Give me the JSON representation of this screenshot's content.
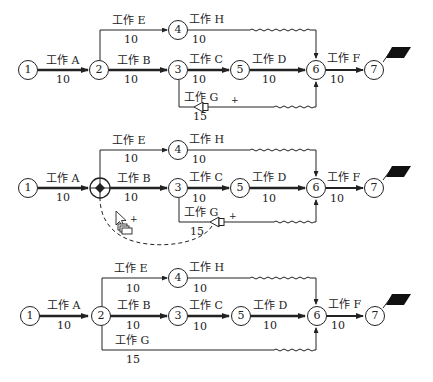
{
  "diagrams": [
    {
      "id": "original",
      "nodes": [
        "1",
        "2",
        "3",
        "4",
        "5",
        "6",
        "7"
      ],
      "activities": {
        "A": {
          "label": "工作 A",
          "duration": "10"
        },
        "B": {
          "label": "工作 B",
          "duration": "10"
        },
        "C": {
          "label": "工作 C",
          "duration": "10"
        },
        "D": {
          "label": "工作 D",
          "duration": "10"
        },
        "E": {
          "label": "工作 E",
          "duration": "10"
        },
        "F": {
          "label": "工作 F",
          "duration": "10"
        },
        "G": {
          "label": "工作 G",
          "duration": "15"
        },
        "H": {
          "label": "工作 H",
          "duration": "10"
        }
      },
      "g_start_node": "3",
      "g_handle_symbol": "+"
    },
    {
      "id": "dragging",
      "nodes": [
        "1",
        "",
        "3",
        "4",
        "5",
        "6",
        "7"
      ],
      "activities": {
        "A": {
          "label": "工作 A",
          "duration": "10"
        },
        "B": {
          "label": "工作 B",
          "duration": "10"
        },
        "C": {
          "label": "工作 C",
          "duration": "10"
        },
        "D": {
          "label": "工作 D",
          "duration": "10"
        },
        "E": {
          "label": "工作 E",
          "duration": "10"
        },
        "F": {
          "label": "工作 F",
          "duration": "10"
        },
        "G": {
          "label": "工作 G",
          "duration": "15"
        },
        "H": {
          "label": "工作 H",
          "duration": "10"
        }
      },
      "g_start_node": "3",
      "g_handle_symbol": "+",
      "cursor_symbol": "+"
    },
    {
      "id": "result",
      "nodes": [
        "1",
        "2",
        "3",
        "4",
        "5",
        "6",
        "7"
      ],
      "activities": {
        "A": {
          "label": "工作 A",
          "duration": "10"
        },
        "B": {
          "label": "工作 B",
          "duration": "10"
        },
        "C": {
          "label": "工作 C",
          "duration": "10"
        },
        "D": {
          "label": "工作 D",
          "duration": "10"
        },
        "E": {
          "label": "工作 E",
          "duration": "10"
        },
        "F": {
          "label": "工作 F",
          "duration": "10"
        },
        "G": {
          "label": "工作 G",
          "duration": "15"
        },
        "H": {
          "label": "工作 H",
          "duration": "10"
        }
      },
      "g_start_node": "2"
    }
  ],
  "colors": {
    "line": "#222222",
    "flag": "#111111",
    "background": "#ffffff"
  }
}
